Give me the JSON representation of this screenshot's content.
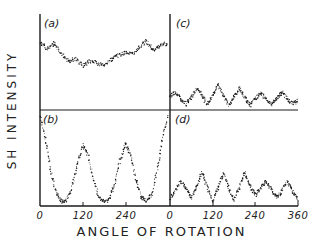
{
  "chart_data": [
    {
      "panel": "a",
      "type": "scatter",
      "label": "(a)",
      "x_range": [
        0,
        360
      ],
      "description": "Weak, broad modulation with noise; no strong periodicity",
      "x": [
        0,
        20,
        40,
        60,
        80,
        100,
        120,
        140,
        160,
        180,
        200,
        220,
        240,
        260,
        280,
        300,
        320,
        340,
        360
      ],
      "y": [
        0.72,
        0.66,
        0.72,
        0.6,
        0.52,
        0.55,
        0.47,
        0.52,
        0.5,
        0.47,
        0.54,
        0.58,
        0.62,
        0.6,
        0.68,
        0.74,
        0.64,
        0.7,
        0.72
      ]
    },
    {
      "panel": "b",
      "type": "scatter",
      "label": "(b)",
      "x_range": [
        0,
        360
      ],
      "description": "Strong threefold modulation with peaks near 0, 120, 240, 360 and near-zero minima",
      "x": [
        0,
        15,
        30,
        45,
        60,
        75,
        90,
        105,
        120,
        135,
        150,
        165,
        180,
        195,
        210,
        225,
        240,
        255,
        270,
        285,
        300,
        315,
        330,
        345,
        360
      ],
      "y": [
        0.98,
        0.72,
        0.38,
        0.12,
        0.03,
        0.04,
        0.18,
        0.45,
        0.65,
        0.55,
        0.28,
        0.07,
        0.03,
        0.05,
        0.22,
        0.48,
        0.67,
        0.55,
        0.27,
        0.07,
        0.04,
        0.1,
        0.38,
        0.72,
        0.98
      ]
    },
    {
      "panel": "c",
      "type": "scatter",
      "label": "(c)",
      "x_range": [
        0,
        360
      ],
      "description": "Small-amplitude sixfold modulation",
      "x": [
        0,
        15,
        30,
        45,
        60,
        75,
        90,
        105,
        120,
        135,
        150,
        165,
        180,
        195,
        210,
        225,
        240,
        255,
        270,
        285,
        300,
        315,
        330,
        345,
        360
      ],
      "y": [
        0.12,
        0.18,
        0.1,
        0.04,
        0.12,
        0.22,
        0.14,
        0.03,
        0.14,
        0.26,
        0.14,
        0.03,
        0.12,
        0.22,
        0.12,
        0.03,
        0.1,
        0.17,
        0.1,
        0.04,
        0.1,
        0.18,
        0.1,
        0.05,
        0.08
      ]
    },
    {
      "panel": "d",
      "type": "scatter",
      "label": "(d)",
      "x_range": [
        0,
        360
      ],
      "description": "Sixfold modulation with larger amplitude; steep rise at start",
      "x": [
        0,
        15,
        30,
        45,
        60,
        75,
        90,
        105,
        120,
        135,
        150,
        165,
        180,
        195,
        210,
        225,
        240,
        255,
        270,
        285,
        300,
        315,
        330,
        345,
        360
      ],
      "y": [
        0.05,
        0.15,
        0.25,
        0.18,
        0.06,
        0.2,
        0.35,
        0.18,
        0.03,
        0.18,
        0.34,
        0.18,
        0.04,
        0.18,
        0.35,
        0.2,
        0.1,
        0.18,
        0.26,
        0.16,
        0.07,
        0.14,
        0.25,
        0.14,
        0.06
      ]
    }
  ],
  "axes": {
    "xlabel": "ANGLE OF ROTATION",
    "ylabel": "SH INTENSITY",
    "ticks": [
      "0",
      "120",
      "240",
      "0",
      "120",
      "240",
      "360"
    ]
  },
  "panels": {
    "a": "(a)",
    "b": "(b)",
    "c": "(c)",
    "d": "(d)"
  },
  "colors": {
    "ink": "#1a1a1a",
    "background": "#ffffff"
  }
}
